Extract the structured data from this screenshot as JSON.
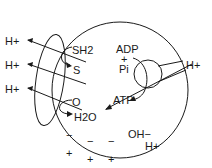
{
  "diagram": {
    "colors": {
      "ink": "#1a1a1a",
      "background": "#ffffff"
    },
    "left_complex": {
      "proton_out_1": "H+",
      "proton_out_2": "H+",
      "proton_out_3": "H+",
      "substrate_1": "SH2",
      "product_1": "S",
      "substrate_2": "O",
      "product_2": "H2O"
    },
    "atp_synthase": {
      "input_1": "ADP",
      "plus": "+",
      "input_2": "Pi",
      "output": "ATP",
      "proton_in": "H+"
    },
    "inside_charges": {
      "minus_signs": [
        "−",
        "−",
        "−"
      ],
      "hydroxide": "OH−"
    },
    "outside_charges": {
      "plus_signs": [
        "+",
        "+",
        "+"
      ],
      "proton": "H+"
    }
  }
}
